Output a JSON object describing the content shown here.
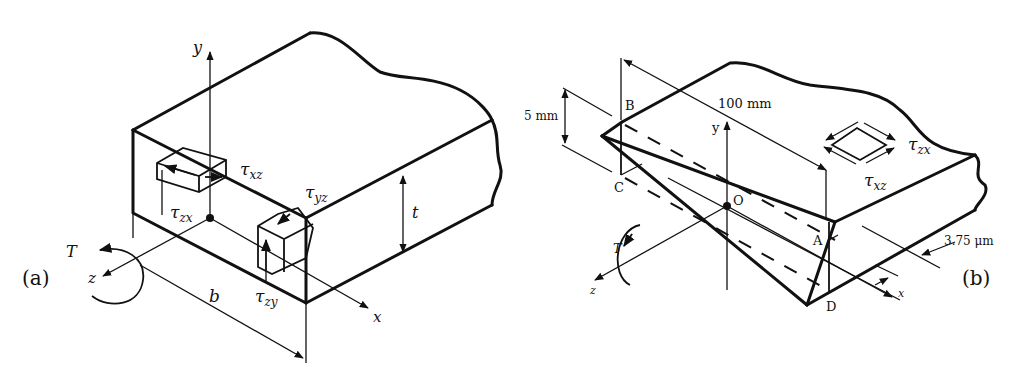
{
  "figure": {
    "panels": [
      {
        "id": "a",
        "panel_label": "(a)",
        "axes": {
          "y": "y",
          "x": "x",
          "z": "z"
        },
        "torque_label": "T",
        "dimension_width": "b",
        "dimension_thickness": "t",
        "stresses": {
          "tau_xz": {
            "sym": "τ",
            "sub": "xz"
          },
          "tau_zx": {
            "sym": "τ",
            "sub": "zx"
          },
          "tau_yz": {
            "sym": "τ",
            "sub": "yz"
          },
          "tau_zy": {
            "sym": "τ",
            "sub": "zy"
          }
        }
      },
      {
        "id": "b",
        "panel_label": "(b)",
        "axes": {
          "y": "y",
          "x": "x",
          "z": "z"
        },
        "origin": "O",
        "torque_label": "T",
        "points": {
          "A": "A",
          "B": "B",
          "C": "C",
          "D": "D"
        },
        "dim_length": "100 mm",
        "dim_height": "5 mm",
        "dim_thickness": "3.75 μm",
        "stresses": {
          "tau_zx": {
            "sym": "τ",
            "sub": "zx"
          },
          "tau_xz": {
            "sym": "τ",
            "sub": "xz"
          }
        }
      }
    ]
  }
}
